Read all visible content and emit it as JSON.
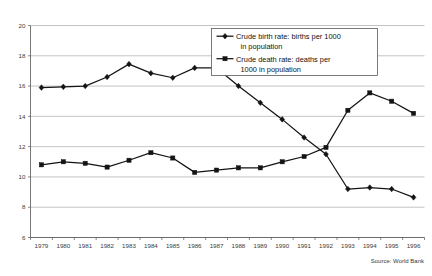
{
  "chart_data": {
    "type": "line",
    "title": "",
    "xlabel": "",
    "ylabel": "",
    "grid": true,
    "legend_position": "inside-top-right",
    "ylim": [
      6,
      20
    ],
    "yticks": [
      6,
      8,
      10,
      12,
      14,
      16,
      18,
      20
    ],
    "categories": [
      "1979",
      "1980",
      "1981",
      "1982",
      "1983",
      "1984",
      "1985",
      "1986",
      "1987",
      "1988",
      "1989",
      "1990",
      "1991",
      "1992",
      "1993",
      "1994",
      "1995",
      "1996"
    ],
    "series": [
      {
        "name": "Crude birth rate:  births per 1000 in population",
        "marker": "diamond",
        "values": [
          15.9,
          15.95,
          16.0,
          16.6,
          17.45,
          16.85,
          16.55,
          17.2,
          17.2,
          16.0,
          14.9,
          13.8,
          12.6,
          11.5,
          9.2,
          9.3,
          9.2,
          8.65
        ]
      },
      {
        "name": "Crude death rate: deaths per 1000 in population",
        "marker": "square",
        "values": [
          10.8,
          11.0,
          10.9,
          10.65,
          11.1,
          11.6,
          11.25,
          10.3,
          10.45,
          10.6,
          10.6,
          11.0,
          11.35,
          11.95,
          14.4,
          15.55,
          15.0,
          14.2
        ]
      }
    ],
    "annotations": {
      "source": "Source: World Bank"
    }
  },
  "legend": {
    "entries": [
      {
        "marker": "diamond-marker-icon",
        "line1": "Crude birth rate:  births per 1000",
        "line2": "in population"
      },
      {
        "marker": "square-marker-icon",
        "line1": "Crude death rate: deaths per",
        "line2": "1000 in population"
      }
    ]
  },
  "footer": {
    "source": "Source: World Bank"
  },
  "colors": {
    "series": "#141414",
    "grid": "#a9a9a9",
    "axis": "#555555",
    "background": "#ffffff"
  }
}
